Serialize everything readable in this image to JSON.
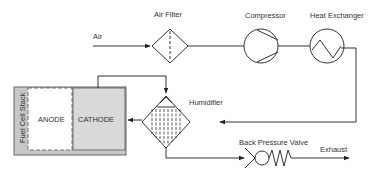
{
  "labels": {
    "air": "Air",
    "air_filter": "Air Filter",
    "compressor": "Compressor",
    "heat_exchanger": "Heat Exchanger",
    "humidifier": "Humidifier",
    "fuel_cell_stack": "Fuel Cell Stack",
    "anode": "ANODE",
    "cathode": "CATHODE",
    "back_pressure_valve": "Back Pressure Valve",
    "exhaust": "Exhaust"
  },
  "colors": {
    "line": "#333333",
    "stack_frame": "#c8c8c8",
    "cathode_fill": "#d9d9d9"
  }
}
